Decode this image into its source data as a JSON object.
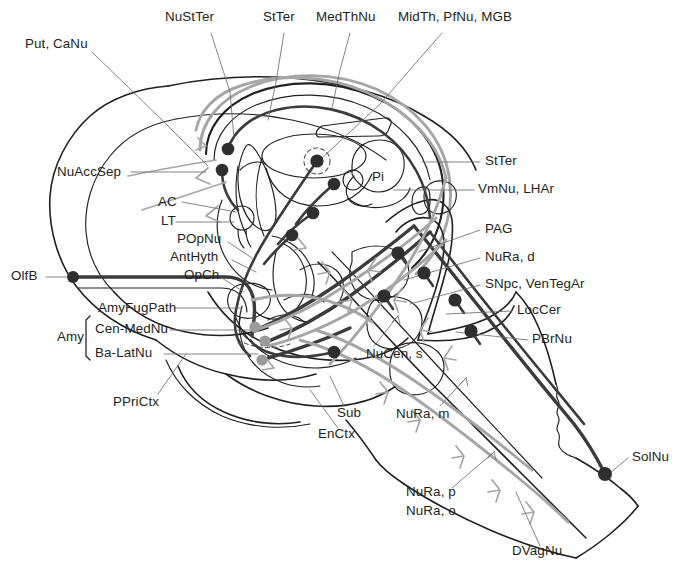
{
  "figure": {
    "kind": "neuroanatomical-schematic",
    "title_visible": false
  },
  "palette": {
    "ink": "#231f20",
    "outline": "#231f20",
    "dark_tract": "#3b3b3d",
    "gray_tract": "#a6a6a8",
    "dark_soma": "#2e2e30",
    "gray_soma": "#9b9b9d",
    "leader": "#6e6e72",
    "background": "#ffffff"
  },
  "labels": {
    "top": [
      {
        "id": "NuStTer",
        "text": "NuStTer",
        "x": 165,
        "y": 17
      },
      {
        "id": "StTer-top",
        "text": "StTer",
        "x": 263,
        "y": 17
      },
      {
        "id": "MedThNu",
        "text": "MedThNu",
        "x": 316,
        "y": 17
      },
      {
        "id": "MidTh-PfNu-MGB",
        "text": "MidTh, PfNu, MGB",
        "x": 398,
        "y": 17
      }
    ],
    "left": [
      {
        "id": "Put-CaNu",
        "text": "Put, CaNu",
        "x": 25,
        "y": 44
      },
      {
        "id": "NuAccSep",
        "text": "NuAccSep",
        "x": 57,
        "y": 168
      },
      {
        "id": "AC",
        "text": "AC",
        "x": 158,
        "y": 198
      },
      {
        "id": "LT",
        "text": "LT",
        "x": 161,
        "y": 217
      },
      {
        "id": "POpNu",
        "text": "POpNu",
        "x": 177,
        "y": 236
      },
      {
        "id": "AntHyth",
        "text": "AntHyth",
        "x": 170,
        "y": 254
      },
      {
        "id": "OpCh",
        "text": "OpCh",
        "x": 184,
        "y": 272
      },
      {
        "id": "OlfB",
        "text": "OlfB",
        "x": 11,
        "y": 272
      },
      {
        "id": "AmyFugPath",
        "text": "AmyFugPath",
        "x": 98,
        "y": 304
      },
      {
        "id": "Amy",
        "text": "Amy",
        "x": 57,
        "y": 336
      },
      {
        "id": "Cen-MedNu",
        "text": "Cen-MedNu",
        "x": 95,
        "y": 325
      },
      {
        "id": "Ba-LatNu",
        "text": "Ba-LatNu",
        "x": 95,
        "y": 349
      },
      {
        "id": "PPriCtx",
        "text": "PPriCtx",
        "x": 113,
        "y": 398
      }
    ],
    "right": [
      {
        "id": "StTer-right",
        "text": "StTer",
        "x": 485,
        "y": 158
      },
      {
        "id": "VmNu-LHAr",
        "text": "VmNu, LHAr",
        "x": 478,
        "y": 186
      },
      {
        "id": "PAG",
        "text": "PAG",
        "x": 485,
        "y": 226
      },
      {
        "id": "NuRa-d",
        "text": "NuRa, d",
        "x": 485,
        "y": 254
      },
      {
        "id": "SNpc-VenTegAr",
        "text": "SNpc, VenTegAr",
        "x": 485,
        "y": 281
      },
      {
        "id": "LocCer",
        "text": "LocCer",
        "x": 517,
        "y": 307
      },
      {
        "id": "PBrNu",
        "text": "PBrNu",
        "x": 532,
        "y": 336
      },
      {
        "id": "SolNu",
        "text": "SolNu",
        "x": 632,
        "y": 454
      }
    ],
    "interior": [
      {
        "id": "Pi",
        "text": "Pi",
        "x": 372,
        "y": 173
      },
      {
        "id": "NuCen-s",
        "text": "NuCen, s",
        "x": 366,
        "y": 351
      },
      {
        "id": "Sub",
        "text": "Sub",
        "x": 337,
        "y": 410
      },
      {
        "id": "EnCtx",
        "text": "EnCtx",
        "x": 318,
        "y": 431
      },
      {
        "id": "NuRa-m",
        "text": "NuRa, m",
        "x": 396,
        "y": 411
      },
      {
        "id": "NuRa-p",
        "text": "NuRa, p",
        "x": 406,
        "y": 489
      },
      {
        "id": "NuRa-o",
        "text": "NuRa, o",
        "x": 406,
        "y": 508
      },
      {
        "id": "DVagNu",
        "text": "DVagNu",
        "x": 512,
        "y": 548
      }
    ]
  },
  "abbreviations": [
    "NuStTer",
    "StTer",
    "MedThNu",
    "MidTh, PfNu, MGB",
    "Put, CaNu",
    "NuAccSep",
    "AC",
    "LT",
    "POpNu",
    "AntHyth",
    "OpCh",
    "OlfB",
    "AmyFugPath",
    "Amy",
    "Cen-MedNu",
    "Ba-LatNu",
    "PPriCtx",
    "VmNu, LHAr",
    "PAG",
    "NuRa, d",
    "SNpc, VenTegAr",
    "LocCer",
    "PBrNu",
    "SolNu",
    "Pi",
    "NuCen, s",
    "Sub",
    "EnCtx",
    "NuRa, m",
    "NuRa, p",
    "NuRa, o",
    "DVagNu"
  ],
  "somata": {
    "dark": [
      {
        "id": "olfb-soma",
        "x": 73,
        "y": 277,
        "r": 6.0
      },
      {
        "id": "nuaccsep-1",
        "x": 228,
        "y": 149,
        "r": 6.3
      },
      {
        "id": "nuaccsep-2",
        "x": 222,
        "y": 170,
        "r": 6.3
      },
      {
        "id": "medth-soma",
        "x": 317,
        "y": 161,
        "r": 6.6
      },
      {
        "id": "mid-soma-1",
        "x": 334,
        "y": 184,
        "r": 6.3
      },
      {
        "id": "mid-soma-2",
        "x": 313,
        "y": 213,
        "r": 6.3
      },
      {
        "id": "mid-soma-3",
        "x": 292,
        "y": 235,
        "r": 6.3
      },
      {
        "id": "amy-dark",
        "x": 334,
        "y": 352,
        "r": 6.3
      },
      {
        "id": "nura-d-soma",
        "x": 398,
        "y": 253,
        "r": 6.6
      },
      {
        "id": "snpc-soma",
        "x": 424,
        "y": 273,
        "r": 6.6
      },
      {
        "id": "loccer-soma",
        "x": 384,
        "y": 296,
        "r": 6.6
      },
      {
        "id": "pbrnu-soma",
        "x": 455,
        "y": 300,
        "r": 6.6
      },
      {
        "id": "raphe-soma",
        "x": 471,
        "y": 331,
        "r": 6.6
      },
      {
        "id": "solnu-soma",
        "x": 605,
        "y": 474,
        "r": 7.0
      }
    ],
    "gray": [
      {
        "id": "cen-medNu",
        "x": 255,
        "y": 327,
        "r": 5.6
      },
      {
        "id": "amy-mid",
        "x": 265,
        "y": 341,
        "r": 5.6
      },
      {
        "id": "ba-latNu",
        "x": 262,
        "y": 360,
        "r": 5.6
      }
    ]
  }
}
